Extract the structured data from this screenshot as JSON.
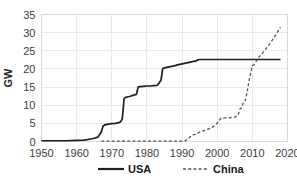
{
  "chart_data": {
    "type": "line",
    "title": "",
    "subtitle": "",
    "xlabel": "",
    "ylabel": "GW",
    "xlim": [
      1950,
      2020
    ],
    "ylim": [
      0,
      35
    ],
    "xticks": [
      1950,
      1960,
      1970,
      1980,
      1990,
      2000,
      2010,
      2020
    ],
    "yticks": [
      0,
      5,
      10,
      15,
      20,
      25,
      30,
      35
    ],
    "xtick_labels": [
      "1950",
      "1960",
      "1970",
      "1980",
      "1990",
      "2000",
      "2010",
      "2020"
    ],
    "ytick_labels": [
      "0",
      "5",
      "10",
      "15",
      "20",
      "25",
      "30",
      "35"
    ],
    "grid": true,
    "legend_position": "bottom",
    "series": [
      {
        "name": "USA",
        "style": "solid",
        "color": "#1f1f1f",
        "x": [
          1950,
          1957,
          1960,
          1962,
          1963,
          1964,
          1965,
          1966,
          1967,
          1967.5,
          1968,
          1969,
          1970,
          1971,
          1972,
          1972.5,
          1973,
          1973.5,
          1974,
          1975,
          1976,
          1977,
          1977.5,
          1978,
          1979,
          1980,
          1981,
          1982,
          1983,
          1984,
          1984.5,
          1985,
          1986,
          1987,
          1988,
          1989,
          1990,
          1991,
          1992,
          1993,
          1994,
          1994.5,
          1995,
          2000,
          2005,
          2010,
          2015,
          2018
        ],
        "y": [
          0.2,
          0.2,
          0.3,
          0.4,
          0.5,
          0.7,
          0.9,
          1.2,
          2.6,
          4.2,
          4.6,
          4.8,
          4.9,
          5.0,
          5.2,
          5.4,
          6.3,
          11.8,
          12.2,
          12.4,
          12.7,
          13.0,
          15.0,
          15.1,
          15.2,
          15.3,
          15.3,
          15.4,
          15.5,
          16.9,
          20.1,
          20.3,
          20.5,
          20.7,
          20.9,
          21.2,
          21.4,
          21.6,
          21.8,
          22.0,
          22.2,
          22.5,
          22.6,
          22.6,
          22.6,
          22.6,
          22.6,
          22.6
        ]
      },
      {
        "name": "China",
        "style": "dashed",
        "color": "#555555",
        "x": [
          1967,
          1975,
          1985,
          1990,
          1991,
          1992,
          1993,
          1994,
          1995,
          1996,
          1997,
          1998,
          1999,
          2000,
          2001,
          2002,
          2003,
          2004,
          2005,
          2005.5,
          2006,
          2006.5,
          2007,
          2007.5,
          2008,
          2008.5,
          2009,
          2009.5,
          2010,
          2010.5,
          2011,
          2012,
          2013,
          2014,
          2015,
          2016,
          2017,
          2018
        ],
        "y": [
          0.1,
          0.1,
          0.1,
          0.1,
          0.2,
          1.0,
          1.8,
          2.0,
          2.6,
          2.9,
          3.3,
          3.6,
          4.2,
          5.0,
          6.4,
          6.5,
          6.5,
          6.6,
          6.7,
          6.9,
          7.5,
          9.0,
          9.4,
          11.0,
          11.3,
          13.5,
          16.5,
          18.8,
          20.9,
          21.2,
          22.0,
          23.4,
          24.5,
          25.7,
          27.0,
          28.4,
          29.9,
          31.5
        ]
      }
    ],
    "legend": [
      {
        "label": "USA",
        "style": "solid",
        "color": "#1f1f1f"
      },
      {
        "label": "China",
        "style": "dashed",
        "color": "#555555"
      }
    ]
  },
  "colors": {
    "background": "#ffffff",
    "grid": "#e9e9e9",
    "frame": "#d8d8d8",
    "usa": "#1f1f1f",
    "china": "#555555",
    "tick_text": "#404040"
  }
}
